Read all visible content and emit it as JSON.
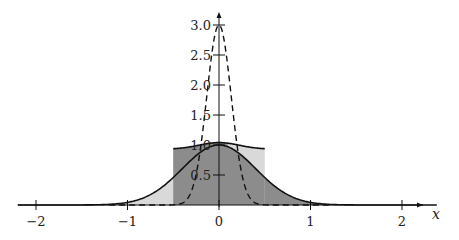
{
  "chart_data": {
    "type": "line",
    "title": "",
    "xlabel": "x",
    "ylabel": "",
    "xlim": [
      -2.2,
      2.4
    ],
    "ylim": [
      0,
      3.2
    ],
    "grid": false,
    "legend": "none",
    "x_ticks": [
      -2,
      -1,
      0,
      1,
      2
    ],
    "x_tick_labels": [
      "−2",
      "−1",
      "0",
      "1",
      "2"
    ],
    "y_ticks": [
      0.5,
      1.0,
      1.5,
      2.0,
      2.5,
      3.0
    ],
    "y_tick_labels": [
      "0.5",
      "1.0",
      "1.5",
      "2.0",
      "2.5",
      "3.0"
    ],
    "series": [
      {
        "name": "gaussian-solid",
        "style": "solid",
        "description": "Gaussian bump, peak 1.0 at x=0, width sigma approx 0.4",
        "peak": 1.0,
        "sigma": 0.4,
        "fill": "light gray outside box, dark gray inside"
      },
      {
        "name": "gaussian-dashed",
        "style": "dashed",
        "description": "Narrow Gaussian, peak 3.0 at x=0",
        "peak": 3.0,
        "sigma": 0.133
      },
      {
        "name": "box-top-curve",
        "style": "solid",
        "description": "Smoothed top over box region, approx 1.05 at center, approx 0.9 at x=±0.5",
        "x_range": [
          -0.5,
          0.5
        ]
      }
    ],
    "regions": [
      {
        "name": "box",
        "x_range": [
          -0.5,
          0.5
        ],
        "height": 0.95,
        "color": "#8c8c8c"
      },
      {
        "name": "light-fill",
        "color": "#d9d9d9"
      }
    ]
  },
  "axes": {
    "x_label": "x"
  }
}
